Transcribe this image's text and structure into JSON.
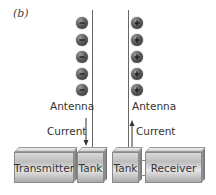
{
  "panel_label": "(b)",
  "left": {
    "charges": [
      "-",
      "-",
      "-",
      "-",
      "-"
    ],
    "charge_type": "negative",
    "antenna_label": "Antenna",
    "current_label": "Current",
    "current_direction": "down"
  },
  "right": {
    "charges": [
      "+",
      "+",
      "+",
      "+",
      "+"
    ],
    "charge_type": "positive",
    "antenna_label": "Antenna",
    "current_label": "Current",
    "current_direction": "up"
  },
  "blocks": {
    "transmitter": "Transmitter",
    "tank_left": "Tank",
    "tank_right": "Tank",
    "receiver": "Receiver"
  },
  "colors": {
    "charge": "#4a4a4a",
    "antenna": "#666666",
    "block": "#c4c4c4",
    "text": "#333333"
  }
}
